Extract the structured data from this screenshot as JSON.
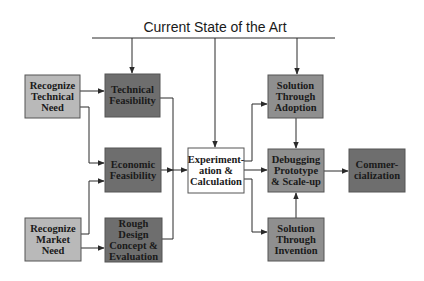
{
  "title": "Current State of the Art",
  "colors": {
    "light": "#b9b9b9",
    "medium": "#8f8f8f",
    "dark": "#6e6e6e",
    "white": "#ffffff",
    "line": "#2a2a2a"
  },
  "nodes": [
    {
      "id": "recognize-technical-need",
      "lines": [
        "Recognize",
        "Technical",
        "Need"
      ],
      "shade": "light"
    },
    {
      "id": "technical-feasibility",
      "lines": [
        "Technical",
        "Feasibility"
      ],
      "shade": "dark"
    },
    {
      "id": "economic-feasibility",
      "lines": [
        "Economic",
        "Feasibility"
      ],
      "shade": "dark"
    },
    {
      "id": "recognize-market-need",
      "lines": [
        "Recognize",
        "Market",
        "Need"
      ],
      "shade": "light"
    },
    {
      "id": "rough-design",
      "lines": [
        "Rough",
        "Design",
        "Concept &",
        "Evaluation"
      ],
      "shade": "dark"
    },
    {
      "id": "experimentation",
      "lines": [
        "Experiment-",
        "ation &",
        "Calculation"
      ],
      "shade": "white"
    },
    {
      "id": "solution-adoption",
      "lines": [
        "Solution",
        "Through",
        "Adoption"
      ],
      "shade": "medium"
    },
    {
      "id": "debugging",
      "lines": [
        "Debugging",
        "Prototype",
        "& Scale-up"
      ],
      "shade": "medium"
    },
    {
      "id": "commercialization",
      "lines": [
        "Commer-",
        "cialization"
      ],
      "shade": "dark"
    },
    {
      "id": "solution-invention",
      "lines": [
        "Solution",
        "Through",
        "Invention"
      ],
      "shade": "medium"
    }
  ],
  "edges": [
    {
      "from": "current-state",
      "to": "technical-feasibility"
    },
    {
      "from": "current-state",
      "to": "experimentation"
    },
    {
      "from": "current-state",
      "to": "solution-adoption"
    },
    {
      "from": "recognize-technical-need",
      "to": "technical-feasibility"
    },
    {
      "from": "recognize-technical-need",
      "to": "economic-feasibility"
    },
    {
      "from": "recognize-market-need",
      "to": "economic-feasibility"
    },
    {
      "from": "recognize-market-need",
      "to": "rough-design"
    },
    {
      "from": "technical-feasibility",
      "to": "experimentation"
    },
    {
      "from": "economic-feasibility",
      "to": "experimentation"
    },
    {
      "from": "rough-design",
      "to": "experimentation"
    },
    {
      "from": "experimentation",
      "to": "solution-adoption"
    },
    {
      "from": "experimentation",
      "to": "debugging"
    },
    {
      "from": "experimentation",
      "to": "solution-invention"
    },
    {
      "from": "solution-adoption",
      "to": "debugging"
    },
    {
      "from": "solution-invention",
      "to": "debugging"
    },
    {
      "from": "debugging",
      "to": "commercialization"
    }
  ]
}
